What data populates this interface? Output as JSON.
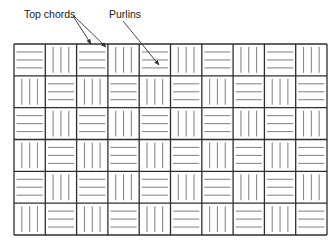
{
  "labels": {
    "top_chords": "Top chords",
    "purlins": "Purlins"
  },
  "grid": {
    "columns": 10,
    "rows": 6,
    "left": 14,
    "top": 44,
    "right": 327,
    "bottom": 235,
    "pattern": "checkerboard",
    "even_cell_lines": "horizontal",
    "odd_cell_lines": "vertical",
    "lines_per_cell": 3
  },
  "colors": {
    "border": "#2e2e2e",
    "hatch": "#8a8a8a",
    "arrow": "#2e2e2e",
    "background": "#ffffff"
  },
  "arrows": [
    {
      "from": [
        73,
        16
      ],
      "to": [
        91,
        44
      ],
      "label": "top_chords"
    },
    {
      "from": [
        74,
        16
      ],
      "to": [
        106,
        47
      ],
      "label": "top_chords"
    },
    {
      "from": [
        123,
        21
      ],
      "to": [
        159,
        65
      ],
      "label": "purlins"
    }
  ]
}
